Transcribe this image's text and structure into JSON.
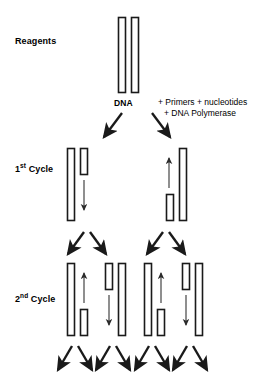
{
  "diagram": {
    "stage_labels": {
      "reagents": "Reagents",
      "cycle1": "1",
      "cycle1_sup": "st",
      "cycle1_word": " Cycle",
      "cycle2": "2",
      "cycle2_sup": "nd",
      "cycle2_word": " Cycle"
    },
    "annotations": {
      "dna": "DNA",
      "additions_line1": "+ Primers + nucleotides",
      "additions_line2": "+ DNA Polymerase"
    },
    "colors": {
      "stroke": "#1a1a1a",
      "fill": "#ffffff",
      "arrow_thin": "#333333",
      "background": "#ffffff"
    }
  },
  "chart_data": {
    "type": "diagram",
    "rows": [
      {
        "name": "reagents",
        "label": "Reagents",
        "strands": [
          {
            "x": 118,
            "y": 17,
            "w": 7,
            "h": 75,
            "kind": "long"
          },
          {
            "x": 131,
            "y": 17,
            "w": 7,
            "h": 75,
            "kind": "long"
          }
        ],
        "arrows": []
      },
      {
        "name": "branch-0",
        "label": "",
        "strands": [],
        "arrows": [
          {
            "x1": 122,
            "y1": 113,
            "x2": 104,
            "y2": 137,
            "kind": "thick"
          },
          {
            "x1": 152,
            "y1": 113,
            "x2": 170,
            "y2": 137,
            "kind": "thick"
          }
        ]
      },
      {
        "name": "cycle1",
        "label": "1st Cycle",
        "strands": [
          {
            "x": 67,
            "y": 148,
            "w": 7,
            "h": 72,
            "kind": "long"
          },
          {
            "x": 80,
            "y": 148,
            "w": 7,
            "h": 26,
            "kind": "short"
          },
          {
            "x": 166,
            "y": 194,
            "w": 7,
            "h": 26,
            "kind": "short"
          },
          {
            "x": 179,
            "y": 148,
            "w": 7,
            "h": 72,
            "kind": "long"
          }
        ],
        "arrows": [
          {
            "x1": 84,
            "y1": 180,
            "x2": 84,
            "y2": 210,
            "kind": "thin-down"
          },
          {
            "x1": 169,
            "y1": 188,
            "x2": 169,
            "y2": 158,
            "kind": "thin-up"
          }
        ]
      },
      {
        "name": "branch-1",
        "label": "",
        "strands": [],
        "arrows": [
          {
            "x1": 84,
            "y1": 232,
            "x2": 68,
            "y2": 254,
            "kind": "thick"
          },
          {
            "x1": 90,
            "y1": 232,
            "x2": 106,
            "y2": 254,
            "kind": "thick"
          },
          {
            "x1": 163,
            "y1": 232,
            "x2": 147,
            "y2": 254,
            "kind": "thick"
          },
          {
            "x1": 169,
            "y1": 232,
            "x2": 185,
            "y2": 254,
            "kind": "thick"
          }
        ]
      },
      {
        "name": "cycle2",
        "label": "2nd Cycle",
        "strands": [
          {
            "x": 67,
            "y": 263,
            "w": 7,
            "h": 72,
            "kind": "long"
          },
          {
            "x": 80,
            "y": 309,
            "w": 7,
            "h": 26,
            "kind": "short"
          },
          {
            "x": 105,
            "y": 263,
            "w": 7,
            "h": 26,
            "kind": "short"
          },
          {
            "x": 118,
            "y": 263,
            "w": 7,
            "h": 72,
            "kind": "long"
          },
          {
            "x": 144,
            "y": 263,
            "w": 7,
            "h": 72,
            "kind": "long"
          },
          {
            "x": 157,
            "y": 309,
            "w": 7,
            "h": 26,
            "kind": "short"
          },
          {
            "x": 182,
            "y": 263,
            "w": 7,
            "h": 26,
            "kind": "short"
          },
          {
            "x": 195,
            "y": 263,
            "w": 7,
            "h": 72,
            "kind": "long"
          }
        ],
        "arrows": [
          {
            "x1": 84,
            "y1": 303,
            "x2": 84,
            "y2": 273,
            "kind": "thin-up"
          },
          {
            "x1": 109,
            "y1": 295,
            "x2": 109,
            "y2": 325,
            "kind": "thin-down"
          },
          {
            "x1": 161,
            "y1": 303,
            "x2": 161,
            "y2": 273,
            "kind": "thin-up"
          },
          {
            "x1": 186,
            "y1": 295,
            "x2": 186,
            "y2": 325,
            "kind": "thin-down"
          }
        ]
      },
      {
        "name": "branch-2",
        "label": "",
        "strands": [],
        "arrows": [
          {
            "x1": 72,
            "y1": 346,
            "x2": 58,
            "y2": 370,
            "kind": "thick"
          },
          {
            "x1": 78,
            "y1": 346,
            "x2": 92,
            "y2": 370,
            "kind": "thick"
          },
          {
            "x1": 110,
            "y1": 346,
            "x2": 96,
            "y2": 370,
            "kind": "thick"
          },
          {
            "x1": 116,
            "y1": 346,
            "x2": 130,
            "y2": 370,
            "kind": "thick"
          },
          {
            "x1": 149,
            "y1": 346,
            "x2": 135,
            "y2": 370,
            "kind": "thick"
          },
          {
            "x1": 155,
            "y1": 346,
            "x2": 169,
            "y2": 370,
            "kind": "thick"
          },
          {
            "x1": 187,
            "y1": 346,
            "x2": 173,
            "y2": 370,
            "kind": "thick"
          },
          {
            "x1": 193,
            "y1": 346,
            "x2": 207,
            "y2": 370,
            "kind": "thick"
          }
        ]
      }
    ]
  }
}
